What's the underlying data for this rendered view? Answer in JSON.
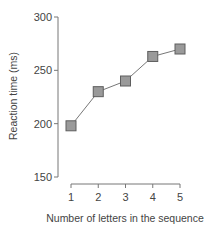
{
  "chart_data": {
    "type": "line",
    "title": "",
    "xlabel": "Number of letters in the sequence",
    "ylabel": "Reaction time (ms)",
    "x": [
      1,
      2,
      3,
      4,
      5
    ],
    "categories": [
      "1",
      "2",
      "3",
      "4",
      "5"
    ],
    "series": [
      {
        "name": "Reaction time",
        "values": [
          198,
          230,
          240,
          263,
          270
        ]
      }
    ],
    "ylim": [
      150,
      300
    ],
    "yticks": [
      150,
      200,
      250,
      300
    ],
    "xticks": [
      1,
      2,
      3,
      4,
      5
    ],
    "grid": false,
    "legend": null,
    "marker": "square",
    "colors": {
      "marker_fill": "#9a9a9a",
      "marker_edge": "#5e5e5e",
      "line": "#777777",
      "axis": "#777777"
    }
  }
}
